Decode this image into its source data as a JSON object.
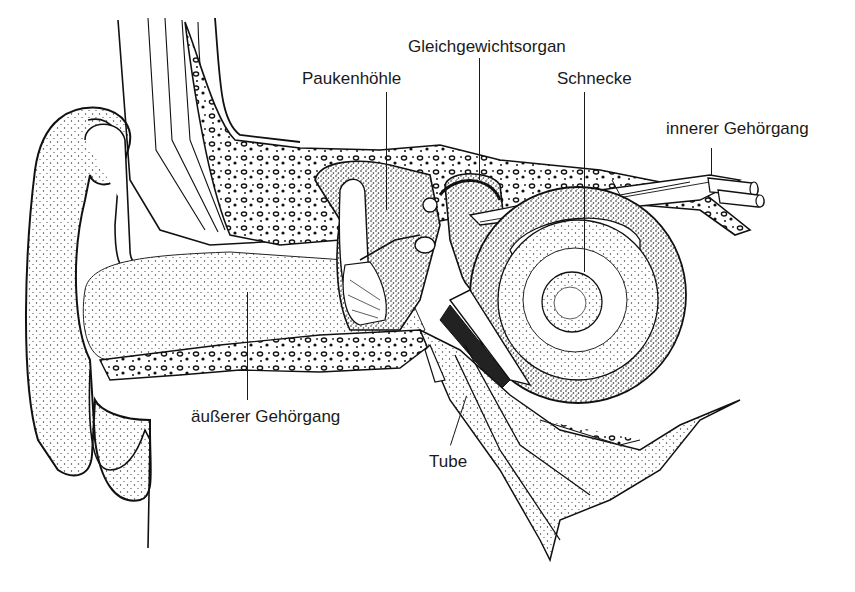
{
  "diagram": {
    "colors": {
      "ink": "#1a1a1a",
      "background": "#ffffff",
      "stipple": "#333333"
    },
    "labels": [
      {
        "id": "gleichgewichtsorgan",
        "text": "Gleichgewichtsorgan",
        "x": 408,
        "y": 37,
        "leader": {
          "x": 479,
          "y1": 58,
          "y2": 180
        }
      },
      {
        "id": "paukenhoehle",
        "text": "Paukenhöhle",
        "x": 302,
        "y": 69,
        "leader": {
          "x": 386,
          "y1": 124,
          "y2": 210
        }
      },
      {
        "id": "schnecke",
        "text": "Schnecke",
        "x": 557,
        "y": 69,
        "leader": {
          "x": 584,
          "y1": 92,
          "y2": 272
        }
      },
      {
        "id": "innerer-gehoergang",
        "text": "innerer Gehörgang",
        "x": 666,
        "y": 119,
        "leader": {
          "x": 711,
          "y1": 148,
          "y2": 176
        }
      },
      {
        "id": "aeusserer-gehoergang",
        "text": "äußerer Gehörgang",
        "x": 191,
        "y": 407,
        "leader": {
          "x": 247,
          "y1": 292,
          "y2": 400
        }
      },
      {
        "id": "tube",
        "text": "Tube",
        "x": 429,
        "y": 452,
        "leader": {
          "x": 459,
          "y1": 395,
          "y2": 446,
          "slant": true
        }
      }
    ]
  }
}
